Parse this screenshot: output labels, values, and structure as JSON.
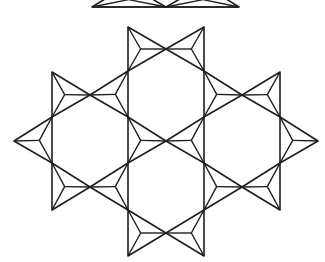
{
  "diagram": {
    "title": "",
    "stroke_color": "#1e1e1e",
    "background": "#ffffff",
    "top_edge_line": {
      "x1": 92,
      "x2": 239,
      "y": 7
    },
    "top_partial_triangles": [
      [
        [
          92,
          7
        ],
        [
          128,
          -15
        ],
        [
          166,
          7
        ]
      ],
      [
        [
          166,
          7
        ],
        [
          204,
          -15
        ],
        [
          239,
          7
        ]
      ]
    ],
    "triangles": [
      [
        [
          128,
          27
        ],
        [
          128,
          71
        ],
        [
          166,
          49
        ]
      ],
      [
        [
          204,
          27
        ],
        [
          204,
          71
        ],
        [
          166,
          49
        ]
      ],
      [
        [
          52,
          72
        ],
        [
          52,
          117
        ],
        [
          90,
          95
        ]
      ],
      [
        [
          128,
          71
        ],
        [
          128,
          117
        ],
        [
          90,
          95
        ]
      ],
      [
        [
          204,
          71
        ],
        [
          204,
          117
        ],
        [
          242,
          95
        ]
      ],
      [
        [
          280,
          72
        ],
        [
          280,
          117
        ],
        [
          242,
          95
        ]
      ],
      [
        [
          52,
          117
        ],
        [
          52,
          163
        ],
        [
          14,
          141
        ]
      ],
      [
        [
          128,
          117
        ],
        [
          128,
          163
        ],
        [
          166,
          141
        ]
      ],
      [
        [
          204,
          117
        ],
        [
          204,
          163
        ],
        [
          166,
          141
        ]
      ],
      [
        [
          280,
          117
        ],
        [
          280,
          163
        ],
        [
          318,
          141
        ]
      ],
      [
        [
          52,
          163
        ],
        [
          52,
          210
        ],
        [
          90,
          187
        ]
      ],
      [
        [
          128,
          163
        ],
        [
          128,
          210
        ],
        [
          90,
          187
        ]
      ],
      [
        [
          204,
          163
        ],
        [
          204,
          210
        ],
        [
          242,
          187
        ]
      ],
      [
        [
          280,
          163
        ],
        [
          280,
          210
        ],
        [
          242,
          187
        ]
      ],
      [
        [
          128,
          210
        ],
        [
          128,
          256
        ],
        [
          166,
          233
        ]
      ],
      [
        [
          204,
          210
        ],
        [
          204,
          256
        ],
        [
          166,
          233
        ]
      ]
    ]
  }
}
